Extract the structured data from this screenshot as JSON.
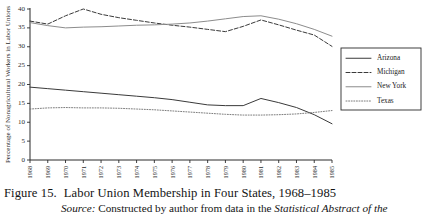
{
  "caption": {
    "figure_number": "Figure 15.",
    "title": "Labor Union Membership in Four States, 1968–1985",
    "source_word": "Source:",
    "source_text": "Constructed by author from data in the",
    "source_title": "Statistical Abstract of the"
  },
  "legend": {
    "items": [
      {
        "label": "Arizona",
        "style": "solid",
        "color": "#3a3a3a",
        "width": 1.0
      },
      {
        "label": "Michigan",
        "style": "dashed",
        "color": "#3a3a3a",
        "width": 1.0
      },
      {
        "label": "New York",
        "style": "solid",
        "color": "#8c8c8c",
        "width": 1.0
      },
      {
        "label": "Texas",
        "style": "dotted",
        "color": "#6e6e6e",
        "width": 0.9
      }
    ]
  },
  "chart_data": {
    "type": "line",
    "title": "Labor Union Membership in Four States, 1968–1985",
    "xlabel": "",
    "ylabel": "Percentage of Nonagricultural Workers in Labor Unions",
    "xlim": [
      1968,
      1985
    ],
    "ylim": [
      0,
      40
    ],
    "yticks": [
      0,
      5,
      10,
      15,
      20,
      25,
      30,
      35,
      40
    ],
    "grid": false,
    "legend_position": "right",
    "categories": [
      "1968",
      "1969",
      "1970",
      "1971",
      "1972",
      "1973",
      "1974",
      "1975",
      "1976",
      "1977",
      "1978",
      "1979",
      "1980",
      "1981",
      "1982",
      "1983",
      "1984",
      "1985"
    ],
    "series": [
      {
        "name": "Arizona",
        "values": [
          19.3,
          18.9,
          18.5,
          18.1,
          17.7,
          17.3,
          16.9,
          16.5,
          16.0,
          15.3,
          14.6,
          14.4,
          14.4,
          16.3,
          15.2,
          13.9,
          12.0,
          9.6
        ]
      },
      {
        "name": "Michigan",
        "values": [
          36.8,
          36.0,
          38.2,
          40.0,
          38.6,
          37.7,
          37.0,
          36.3,
          35.7,
          35.2,
          34.6,
          34.0,
          35.4,
          37.1,
          35.8,
          34.4,
          33.1,
          30.1
        ]
      },
      {
        "name": "New York",
        "values": [
          36.4,
          35.6,
          35.0,
          35.2,
          35.3,
          35.5,
          35.7,
          35.8,
          36.0,
          36.3,
          36.8,
          37.4,
          38.0,
          38.2,
          37.3,
          36.1,
          34.6,
          32.8
        ]
      },
      {
        "name": "Texas",
        "values": [
          13.5,
          13.8,
          13.9,
          13.8,
          13.8,
          13.7,
          13.5,
          13.3,
          13.0,
          12.7,
          12.4,
          12.1,
          11.9,
          11.9,
          12.0,
          12.2,
          12.6,
          13.1
        ]
      }
    ]
  }
}
